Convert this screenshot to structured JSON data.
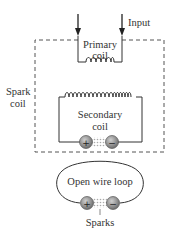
{
  "diagram": {
    "input_label": "Input",
    "spark_coil_label": [
      "Spark",
      "coil"
    ],
    "primary_coil_label": [
      "Primary",
      "coil"
    ],
    "secondary_coil_label": [
      "Secondary",
      "coil"
    ],
    "open_loop_label": "Open wire loop",
    "sparks_label": "Sparks",
    "terminal_positive": "+",
    "terminal_negative": "−",
    "colors": {
      "line": "#333333",
      "dashed_box": "#555555",
      "terminal_fill": "#8a8a8a",
      "spark_gap": "#bbbbbb"
    }
  }
}
